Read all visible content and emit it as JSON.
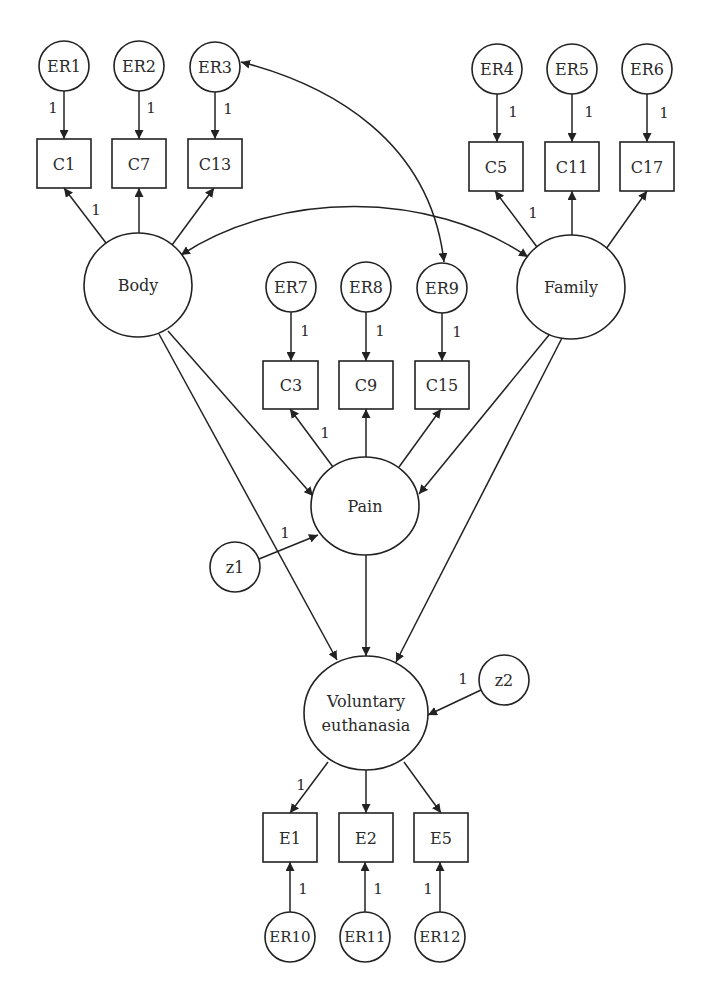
{
  "diagram": {
    "type": "structural-equation-model",
    "colors": {
      "stroke": "#222222",
      "text": "#2a2a2a",
      "background": "#ffffff"
    },
    "latent": [
      {
        "id": "body",
        "label": "Body",
        "cx": 138,
        "cy": 285,
        "rx": 54,
        "ry": 52
      },
      {
        "id": "family",
        "label": "Family",
        "cx": 571,
        "cy": 287,
        "rx": 54,
        "ry": 52
      },
      {
        "id": "pain",
        "label": "Pain",
        "cx": 365,
        "cy": 506,
        "rx": 54,
        "ry": 49
      },
      {
        "id": "ve",
        "label": "Voluntary",
        "label2": "euthanasia",
        "cx": 366,
        "cy": 713,
        "rx": 62,
        "ry": 57
      }
    ],
    "errors": [
      {
        "id": "ER1",
        "label": "ER1",
        "cx": 64,
        "cy": 66
      },
      {
        "id": "ER2",
        "label": "ER2",
        "cx": 139,
        "cy": 66
      },
      {
        "id": "ER3",
        "label": "ER3",
        "cx": 215,
        "cy": 67
      },
      {
        "id": "ER4",
        "label": "ER4",
        "cx": 497,
        "cy": 69
      },
      {
        "id": "ER5",
        "label": "ER5",
        "cx": 572,
        "cy": 69
      },
      {
        "id": "ER6",
        "label": "ER6",
        "cx": 647,
        "cy": 69
      },
      {
        "id": "ER7",
        "label": "ER7",
        "cx": 291,
        "cy": 287
      },
      {
        "id": "ER8",
        "label": "ER8",
        "cx": 366,
        "cy": 287
      },
      {
        "id": "ER9",
        "label": "ER9",
        "cx": 442,
        "cy": 288
      },
      {
        "id": "z1",
        "label": "z1",
        "cx": 235,
        "cy": 567
      },
      {
        "id": "z2",
        "label": "z2",
        "cx": 504,
        "cy": 680
      },
      {
        "id": "ER10",
        "label": "ER10",
        "cx": 290,
        "cy": 937
      },
      {
        "id": "ER11",
        "label": "ER11",
        "cx": 365,
        "cy": 937
      },
      {
        "id": "ER12",
        "label": "ER12",
        "cx": 440,
        "cy": 937
      }
    ],
    "observed": [
      {
        "id": "C1",
        "label": "C1",
        "x": 37,
        "y": 139,
        "w": 54,
        "h": 49
      },
      {
        "id": "C7",
        "label": "C7",
        "x": 112,
        "y": 139,
        "w": 54,
        "h": 49
      },
      {
        "id": "C13",
        "label": "C13",
        "x": 188,
        "y": 139,
        "w": 54,
        "h": 49
      },
      {
        "id": "C5",
        "label": "C5",
        "x": 469,
        "y": 142,
        "w": 54,
        "h": 49
      },
      {
        "id": "C11",
        "label": "C11",
        "x": 545,
        "y": 142,
        "w": 54,
        "h": 49
      },
      {
        "id": "C17",
        "label": "C17",
        "x": 620,
        "y": 142,
        "w": 54,
        "h": 49
      },
      {
        "id": "C3",
        "label": "C3",
        "x": 263,
        "y": 361,
        "w": 55,
        "h": 48
      },
      {
        "id": "C9",
        "label": "C9",
        "x": 339,
        "y": 361,
        "w": 54,
        "h": 48
      },
      {
        "id": "C15",
        "label": "C15",
        "x": 415,
        "y": 361,
        "w": 54,
        "h": 48
      },
      {
        "id": "E1",
        "label": "E1",
        "x": 263,
        "y": 813,
        "w": 54,
        "h": 49
      },
      {
        "id": "E2",
        "label": "E2",
        "x": 339,
        "y": 813,
        "w": 54,
        "h": 49
      },
      {
        "id": "E5",
        "label": "E5",
        "x": 414,
        "y": 813,
        "w": 54,
        "h": 49
      }
    ],
    "weights": [
      {
        "label": "1",
        "x": 53,
        "y": 108
      },
      {
        "label": "1",
        "x": 151,
        "y": 108
      },
      {
        "label": "1",
        "x": 228,
        "y": 109
      },
      {
        "label": "1",
        "x": 96,
        "y": 210
      },
      {
        "label": "1",
        "x": 513,
        "y": 112
      },
      {
        "label": "1",
        "x": 589,
        "y": 112
      },
      {
        "label": "1",
        "x": 664,
        "y": 113
      },
      {
        "label": "1",
        "x": 533,
        "y": 213
      },
      {
        "label": "1",
        "x": 305,
        "y": 331
      },
      {
        "label": "1",
        "x": 380,
        "y": 331
      },
      {
        "label": "1",
        "x": 457,
        "y": 332
      },
      {
        "label": "1",
        "x": 325,
        "y": 433
      },
      {
        "label": "1",
        "x": 285,
        "y": 533
      },
      {
        "label": "1",
        "x": 463,
        "y": 679
      },
      {
        "label": "1",
        "x": 301,
        "y": 785
      },
      {
        "label": "1",
        "x": 303,
        "y": 889
      },
      {
        "label": "1",
        "x": 378,
        "y": 889
      },
      {
        "label": "1",
        "x": 428,
        "y": 889
      }
    ]
  }
}
